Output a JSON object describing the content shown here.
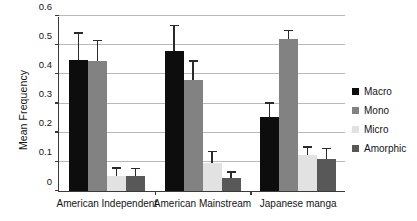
{
  "chart_data": {
    "type": "bar",
    "title": "",
    "xlabel": "",
    "ylabel": "Mean Frequency",
    "ylim": [
      0,
      0.6
    ],
    "yticks": [
      "0",
      "0.1",
      "0.2",
      "0.3",
      "0.4",
      "0.5",
      "0.6"
    ],
    "ytick_values": [
      0,
      0.1,
      0.2,
      0.3,
      0.4,
      0.5,
      0.6
    ],
    "grid": true,
    "legend_position": "right",
    "categories": [
      "American Independent",
      "American Mainstream",
      "Japanese manga"
    ],
    "series": [
      {
        "name": "Macro",
        "color": "#0d0d0d",
        "values": [
          0.45,
          0.48,
          0.255
        ],
        "error_upper": [
          0.09,
          0.085,
          0.045
        ]
      },
      {
        "name": "Mono",
        "color": "#828282",
        "values": [
          0.445,
          0.38,
          0.52
        ],
        "error_upper": [
          0.068,
          0.063,
          0.028
        ]
      },
      {
        "name": "Micro",
        "color": "#e2e2e2",
        "values": [
          0.05,
          0.095,
          0.125
        ],
        "error_upper": [
          0.026,
          0.038,
          0.023
        ]
      },
      {
        "name": "Amorphic",
        "color": "#585858",
        "values": [
          0.05,
          0.045,
          0.11
        ],
        "error_upper": [
          0.024,
          0.018,
          0.033
        ]
      }
    ]
  },
  "legend": {
    "items": [
      {
        "label": "Macro",
        "color": "#0d0d0d"
      },
      {
        "label": "Mono",
        "color": "#828282"
      },
      {
        "label": "Micro",
        "color": "#e2e2e2"
      },
      {
        "label": "Amorphic",
        "color": "#585858"
      }
    ]
  }
}
